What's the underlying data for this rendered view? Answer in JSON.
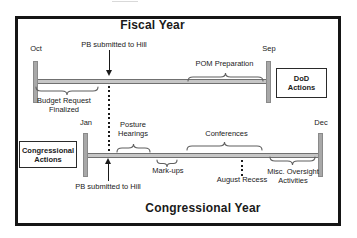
{
  "colors": {
    "frame": "#151515",
    "bar-fill": "#c6c6c6",
    "bar-edge": "#707070",
    "tick-fill": "#a8a8a8",
    "tick-edge": "#8a8a8a",
    "brace": "#5f5f5f",
    "text": "#1a1a1a"
  },
  "titles": {
    "fiscal": "Fiscal Year",
    "congressional": "Congressional Year"
  },
  "fiscal_timeline": {
    "start_month": "Oct",
    "end_month": "Sep",
    "pb_annotation": "PB submitted to Hill",
    "pom_annotation": "POM Preparation",
    "budget_annotation": "Budget Request\nFinalized",
    "actions_box": "DoD\nActions"
  },
  "congressional_timeline": {
    "start_month": "Jan",
    "end_month": "Dec",
    "actions_box": "Congressional\nActions",
    "posture_annotation": "Posture\nHearings",
    "markups_annotation": "Mark-ups",
    "conferences_annotation": "Conferences",
    "august_annotation": "August Recess",
    "misc_annotation": "Misc. Oversight\nActivities",
    "pb_annotation": "PB submitted to Hill"
  }
}
